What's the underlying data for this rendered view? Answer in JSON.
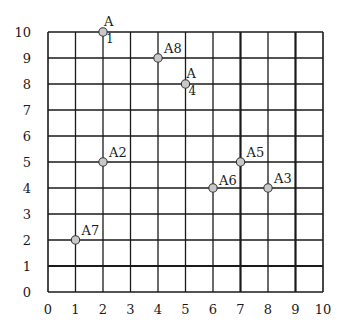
{
  "chart_data": {
    "type": "scatter",
    "title": "",
    "xlabel": "",
    "ylabel": "",
    "xlim": [
      0,
      10
    ],
    "ylim": [
      0,
      10
    ],
    "grid": true,
    "x_ticks": [
      "0",
      "1",
      "2",
      "3",
      "4",
      "5",
      "6",
      "7",
      "8",
      "9",
      "10"
    ],
    "y_ticks": [
      "0",
      "1",
      "2",
      "3",
      "4",
      "5",
      "6",
      "7",
      "8",
      "9",
      "10"
    ],
    "heavy_gridlines": {
      "x": [
        7,
        9
      ],
      "y": [
        1
      ]
    },
    "legend": null,
    "points": [
      {
        "label": "A1",
        "x": 2,
        "y": 10,
        "label_style": "split"
      },
      {
        "label": "A2",
        "x": 2,
        "y": 5,
        "label_style": "inline"
      },
      {
        "label": "A3",
        "x": 8,
        "y": 4,
        "label_style": "inline"
      },
      {
        "label": "A4",
        "x": 5,
        "y": 8,
        "label_style": "split"
      },
      {
        "label": "A5",
        "x": 7,
        "y": 5,
        "label_style": "inline"
      },
      {
        "label": "A6",
        "x": 6,
        "y": 4,
        "label_style": "inline-left"
      },
      {
        "label": "A7",
        "x": 1,
        "y": 2,
        "label_style": "inline"
      },
      {
        "label": "A8",
        "x": 4,
        "y": 9,
        "label_style": "inline"
      }
    ]
  },
  "colors": {
    "grid": "#1a1a1a",
    "point_fill": "#c8c8c8",
    "point_stroke": "#333333",
    "text": "#1a1a1a",
    "background": "#ffffff"
  }
}
